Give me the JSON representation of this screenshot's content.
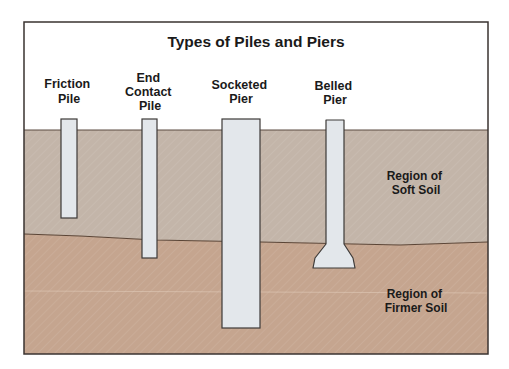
{
  "title": "Types of Piles and Piers",
  "colors": {
    "frame": "#3a3330",
    "background": "#ffffff",
    "soft_soil": "#c3b5a9",
    "firm_soil": "#c5a58f",
    "pier_fill": "#e3e7eb",
    "pier_stroke": "#3d3a38",
    "boundary": "#5b4536"
  },
  "piles": [
    {
      "id": "friction-pile",
      "label_lines": [
        "Friction",
        "Pile"
      ]
    },
    {
      "id": "end-contact-pile",
      "label_lines": [
        "End",
        "Contact",
        "Pile"
      ]
    },
    {
      "id": "socketed-pier",
      "label_lines": [
        "Socketed",
        "Pier"
      ]
    },
    {
      "id": "belled-pier",
      "label_lines": [
        "Belled",
        "Pier"
      ]
    }
  ],
  "regions": {
    "soft_soil": {
      "lines": [
        "Region of",
        "Soft Soil"
      ]
    },
    "firm_soil": {
      "lines": [
        "Region of",
        "Firmer Soil"
      ]
    }
  }
}
